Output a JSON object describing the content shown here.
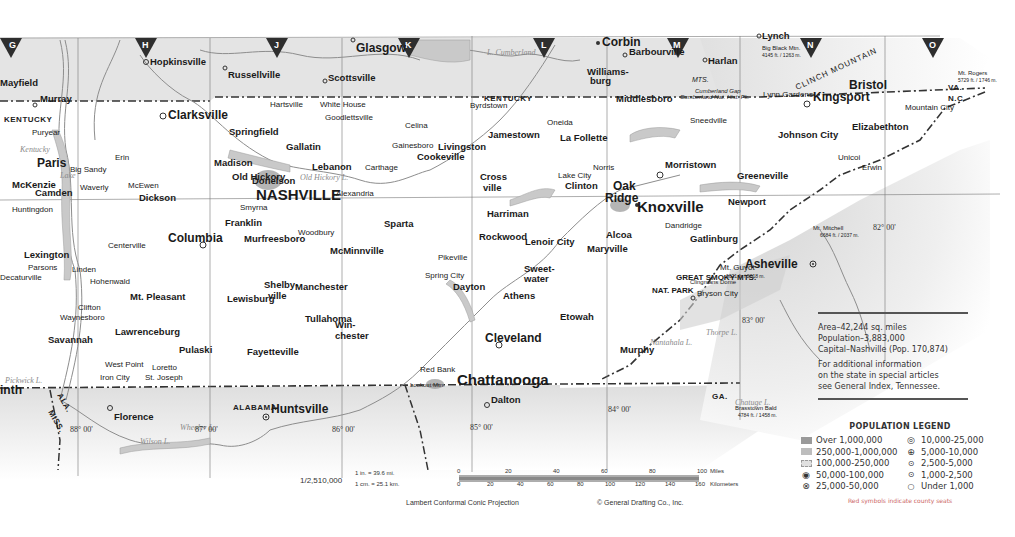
{
  "map": {
    "state": "Tennessee",
    "grid_letters": [
      "G",
      "H",
      "J",
      "K",
      "L",
      "M",
      "N",
      "O"
    ],
    "neighbor_states": [
      "KENTUCKY",
      "VA.",
      "N.C.",
      "GA.",
      "ALABAMA",
      "ALA.",
      "MISS.",
      "GA.",
      "ALA."
    ],
    "state_labels": {
      "kentucky_west": "KENTUCKY",
      "kentucky_center": "KENTUCKY",
      "va": "VA.",
      "nc": "N.C.",
      "ga": "GA.",
      "alabama": "ALABAMA",
      "ala": "ALA.",
      "miss": "MISS.",
      "ga_ala": "GA. ALA."
    },
    "outside_cities": {
      "hopkinsville": "Hopkinsville",
      "russellville": "Russellville",
      "scottsville": "Scottsville",
      "glasgow": "Glasgow",
      "corbin": "Corbin",
      "barbourville": "Barbourville",
      "williamsburg_1": "Williams-",
      "williamsburg_2": "burg",
      "harlan": "Harlan",
      "lynch": "Lynch",
      "mayfield": "Mayfield",
      "murray": "Murray",
      "huntsville": "Huntsville",
      "florence": "Florence",
      "dalton": "Dalton",
      "asheville": "Asheville",
      "bryson_city": "Bryson City",
      "murphy": "Murphy",
      "corinth": "inth"
    },
    "major_cities": {
      "nashville": "NASHVILLE",
      "knoxville": "Knoxville",
      "chattanooga": "Chattanooga",
      "clarksville": "Clarksville",
      "bristol": "Bristol",
      "kingsport": "Kingsport",
      "johnson_city": "Johnson City",
      "oak_ridge_1": "Oak",
      "oak_ridge_2": "Ridge",
      "murfreesboro": "Murfreesboro",
      "columbia": "Columbia",
      "cleveland": "Cleveland",
      "jackson": "Jackson",
      "morristown": "Morristown",
      "athens": "Athens",
      "maryville": "Maryville",
      "cookeville": "Cookeville",
      "paris": "Paris",
      "lewisburg": "Lewisburg",
      "mcminnville": "McMinnville",
      "tullahoma": "Tullahoma",
      "shelbyville_1": "Shelby-",
      "shelbyville_2": "ville",
      "lawrenceburg": "Lawrenceburg",
      "dickson": "Dickson",
      "franklin": "Franklin",
      "springfield": "Springfield",
      "gallatin": "Gallatin",
      "lebanon": "Lebanon",
      "mckenzie": "McKenzie",
      "camden": "Camden",
      "lexington": "Lexington",
      "savannah": "Savannah",
      "pulaski": "Pulaski",
      "fayetteville": "Fayetteville",
      "winchester_1": "Win-",
      "winchester_2": "chester",
      "newport": "Newport",
      "greeneville": "Greeneville",
      "elizabethton": "Elizabethton",
      "middlesboro": "Middlesboro",
      "lafollette": "La Follette",
      "jamestown": "Jamestown",
      "livingston": "Livingston",
      "sparta": "Sparta",
      "gatlinburg": "Gatlinburg",
      "harriman": "Harriman",
      "rockwood": "Rockwood",
      "lenoir_city": "Lenoir City",
      "sweetwater_1": "Sweet-",
      "sweetwater_2": "water",
      "dayton": "Dayton",
      "madison": "Madison",
      "donelson": "Donelson",
      "old_hickory": "Old Hickory",
      "mt_pleasant": "Mt. Pleasant",
      "manchester": "Manchester",
      "crossville_1": "Cross",
      "crossville_2": "ville",
      "clinton": "Clinton",
      "alcoa": "Alcoa",
      "lynn_gardens": "Lynn Gardens",
      "etowah": "Etowah"
    },
    "small_towns": [
      "Puryear",
      "Cottage Grove",
      "Erin",
      "Waverly",
      "McEwen",
      "Big Sandy",
      "New Johnsonville",
      "Huntingdon",
      "Parsons",
      "Decaturville",
      "Scotts Hill",
      "Hohenwald",
      "Linden",
      "Centerville",
      "Waynesboro",
      "Clifton",
      "Loretto",
      "West Point",
      "Iron City",
      "St. Joseph",
      "Lutts",
      "Collinwood",
      "Ethridge",
      "Summertown",
      "Culleoka",
      "Spring Hill",
      "Chapel Hill",
      "Smyrna",
      "Woodbury",
      "Alexandria",
      "Carthage",
      "Gainesboro",
      "Celina",
      "Byrdstown",
      "Oneida",
      "Huntsville",
      "Jacksboro",
      "Lake City",
      "Norris",
      "Wartburg",
      "Kingston",
      "Loudon",
      "Madisonville",
      "Englewood",
      "Riceville",
      "Decatur",
      "Spring City",
      "Pikeville",
      "Spencer",
      "Dunlap",
      "Jasper",
      "Whitwell",
      "Signal Mtn.",
      "Red Bank",
      "Soddy",
      "Daisy",
      "Benton",
      "Ducktown",
      "Copperhill",
      "Tellico Plains",
      "Vonore",
      "Sevierville",
      "Pigeon Forge",
      "Dandridge",
      "Jefferson City",
      "Rogersville",
      "Sneedville",
      "Tazewell",
      "Harrogate",
      "Mountain City",
      "Erwin",
      "Unicoi",
      "Jonesboro",
      "Elizabethton",
      "Shell Cr.",
      "Roan Mtn.",
      "Hampton",
      "Blountville",
      "Church Hill",
      "Rutledge",
      "Maynardville",
      "Portland",
      "Westmoreland",
      "Lafayette",
      "Red Boiling Sprs.",
      "Hartsville",
      "White House",
      "Goodlettsville",
      "Ashland City",
      "Charlotte",
      "Kingston Springs",
      "Fairview",
      "Brentwood",
      "Lynchburg",
      "Cowan",
      "Sewanee",
      "Monteagle",
      "Tracy City",
      "Altamont",
      "Morrison",
      "Viola",
      "Beersheba Sprs.",
      "Elora",
      "Huntland",
      "Taft",
      "Kelso",
      "Prospect",
      "Minor Hill",
      "Lynnville",
      "Belfast",
      "Petersburg",
      "Cornersville",
      "Bell Buckle",
      "Wartrace",
      "Normandy",
      "Christiana",
      "Eagleville",
      "Pickwick Dam",
      "Adamsville",
      "Selmer",
      "Milledgeville",
      "Sardis",
      "Dover",
      "Indian Mound",
      "Big Rock",
      "Adams",
      "Cedar Hill",
      "Cross Plains",
      "Orlinda",
      "Fountain Head",
      "Bethpage",
      "Dixon Springs",
      "Rome",
      "Gordonsville",
      "Baxter",
      "Monterey",
      "Algood",
      "Grimsley",
      "Deer Lodge",
      "Sunbright",
      "Robbins",
      "Allardt",
      "Petros",
      "Oliver Sprs.",
      "Oakdale",
      "Ozone",
      "Crab Orchard",
      "Greenback",
      "Friendsville",
      "Walland",
      "Townsend",
      "Kodak",
      "Chestnut Hill",
      "Newport",
      "Hartford",
      "Parrottsville",
      "Mosheim",
      "Bulls Gap",
      "Baileyton",
      "Tusculum",
      "Limestone",
      "Telford",
      "Gray",
      "Piney Flats",
      "Bluff City",
      "Shady Valley",
      "Butler",
      "Trade",
      "Bristol"
    ],
    "water_labels": {
      "l_cumberland": "L. Cumberland",
      "kentucky_lake": "Kentucky",
      "lake": "Lake",
      "old_hickory_l": "Old Hickory L.",
      "center_hill_l": "Center Hill L.",
      "dale_hollow": "Dale Hollow",
      "norris_l": "Norris L.",
      "douglas_l": "Douglas L.",
      "chickamauga_l": "Chickamauga L.",
      "watts_bar_l": "Watts Bar L.",
      "fontana_l": "Fontana L.",
      "hiwassee_l": "Hiwassee L.",
      "nantahala_l": "Nantahala L.",
      "chatuge_l": "Chatuge L.",
      "thorpe_l": "Thorpe L.",
      "wilson_l": "Wilson L.",
      "wheeler_l": "Wheeler L.",
      "pickwick_l": "Pickwick L.",
      "boone_l": "Boone L.",
      "s_holston_l": "S. Holston L.",
      "watauga_l": "Watauga L.",
      "great_falls_l": "Great Falls L.",
      "tims_ford_l": "Tims Ford L.",
      "woods_res": "Woods Res.",
      "tennessee_r": "Tennessee",
      "cumberland_r": "Cumberland"
    },
    "landmarks": {
      "great_smoky_mts": "GREAT SMOKY MTS.",
      "nat_park": "NAT. PARK",
      "clingmans_dome": "Clingmans Dome",
      "mt_guyot": "Mt. Guyot",
      "mt_guyot_elev": "6621 ft. / 2018 m.",
      "big_black_mtn": "Big Black Mtn.",
      "big_black_elev": "4145 ft. / 1263 m.",
      "mt_rogers": "Mt. Rogers",
      "mt_rogers_elev": "5729 ft. / 1746 m.",
      "mt_mitchell": "Mt. Mitchell",
      "mt_mitchell_elev": "6684 ft. / 2037 m.",
      "brasstown_bald": "Brasstown Bald",
      "brasstown_elev": "4784 ft. / 1458 m.",
      "clinch_mountain": "CLINCH MOUNTAIN",
      "cumberland_gap": "Cumberland Gap",
      "cumberland_gap_park": "Cumberland Nat. Hist. Pk.",
      "mts": "MTS.",
      "lookout_mtn": "Lookout Mtn.",
      "meriwether_lewis": "Meriwether Lewis",
      "nat_mon": "Nat. Mon.",
      "andrew_johnson": "Andrew Johnson",
      "nat_mon2": "Nat. Mon.",
      "shiloh": "Shiloh Nat. Mil. Pk.",
      "ft_donelson": "Ft. Donelson Nat. Mil."
    },
    "counties": [
      "STEWART",
      "MONTGOMERY",
      "ROBERTSON",
      "SUMNER",
      "MACON",
      "CLAY",
      "FENTRESS",
      "CAMPBELL",
      "CLAIBORNE",
      "HANCOCK",
      "HAWKINS",
      "SULLIVAN",
      "JOHNSON",
      "CARTER",
      "WASHINGTON",
      "GREENE",
      "HAMBLEN",
      "JEFFERSON",
      "COCKE",
      "SEVIER",
      "BLOUNT",
      "MONROE",
      "POLK",
      "BRADLEY",
      "HAMILTON",
      "MARION",
      "GRUNDY",
      "FRANKLIN",
      "LINCOLN",
      "GILES",
      "LAWRENCE",
      "WAYNE",
      "HARDIN",
      "DECATUR",
      "PERRY",
      "LEWIS",
      "MAURY",
      "MARSHALL",
      "BEDFORD",
      "COFFEE",
      "WARREN",
      "VAN BUREN",
      "WHITE",
      "PUTNAM",
      "OVERTON",
      "JACKSON",
      "SMITH",
      "WILSON",
      "RUTHERFORD",
      "CANNON",
      "DAVIDSON",
      "WILLIAMSON",
      "HICKMAN",
      "DICKSON",
      "CHEATHAM",
      "HOUSTON",
      "HUMPHREYS",
      "BENTON",
      "HENRY",
      "CARROLL",
      "HENDERSON",
      "MORGAN",
      "ROANE",
      "ANDERSON",
      "UNION",
      "GRAINGER",
      "UNICOI",
      "LOUDON",
      "MEIGS",
      "MCMINN",
      "RHEA",
      "BLEDSOE",
      "CUMBERLAND",
      "SEQUATCHIE",
      "DEKALB",
      "TROUSDALE",
      "MOORE"
    ],
    "longitudes": [
      "88° 00'",
      "87° 00'",
      "86° 00'",
      "85° 00'",
      "84° 00'",
      "83° 00'",
      "82° 00'"
    ]
  },
  "info_box": {
    "area": "Area–42,244 sq. miles",
    "population": "Population–3,883,000",
    "capital": "Capital–Nashville (Pop. 170,874)",
    "note_1": "For additional information",
    "note_2": "on the state in special articles",
    "note_3": "see General Index, Tennessee."
  },
  "legend": {
    "title": "POPULATION LEGEND",
    "items": [
      {
        "symbol": "swatch-dense",
        "label": "Over 1,000,000"
      },
      {
        "symbol": "double-ring",
        "label": "10,000-25,000"
      },
      {
        "symbol": "swatch-medium",
        "label": "250,000-1,000,000"
      },
      {
        "symbol": "circle-plus",
        "label": "5,000-10,000"
      },
      {
        "symbol": "swatch-light",
        "label": "100,000-250,000"
      },
      {
        "symbol": "circle-dot-small",
        "label": "2,500-5,000"
      },
      {
        "symbol": "circle-filled-dot",
        "label": "50,000-100,000"
      },
      {
        "symbol": "circle-center",
        "label": "1,000-2,500"
      },
      {
        "symbol": "circle-cross",
        "label": "25,000-50,000"
      },
      {
        "symbol": "open-circle",
        "label": "Under 1,000"
      }
    ],
    "note": "Red symbols indicate county seats",
    "accent": "#c86464"
  },
  "scale": {
    "ratio": "1/2,510,000",
    "miles_line": "1 in. = 39.6 mi.",
    "km_line": "1 cm. = 25.1 km.",
    "mile_ticks": [
      "0",
      "20",
      "40",
      "60",
      "80",
      "100"
    ],
    "mile_unit": "Miles",
    "km_ticks": [
      "0",
      "20",
      "40",
      "60",
      "80",
      "100",
      "120",
      "140",
      "160"
    ],
    "km_unit": "Kilometers",
    "projection": "Lambert Conformal Conic Projection",
    "copyright": "© General Drafting Co., Inc."
  },
  "colors": {
    "paper": "#ffffff",
    "outside_state": "#e2e2e2",
    "border": "#333333",
    "water": "#c9c9c9",
    "grid_marker": "#2e2e2e"
  }
}
